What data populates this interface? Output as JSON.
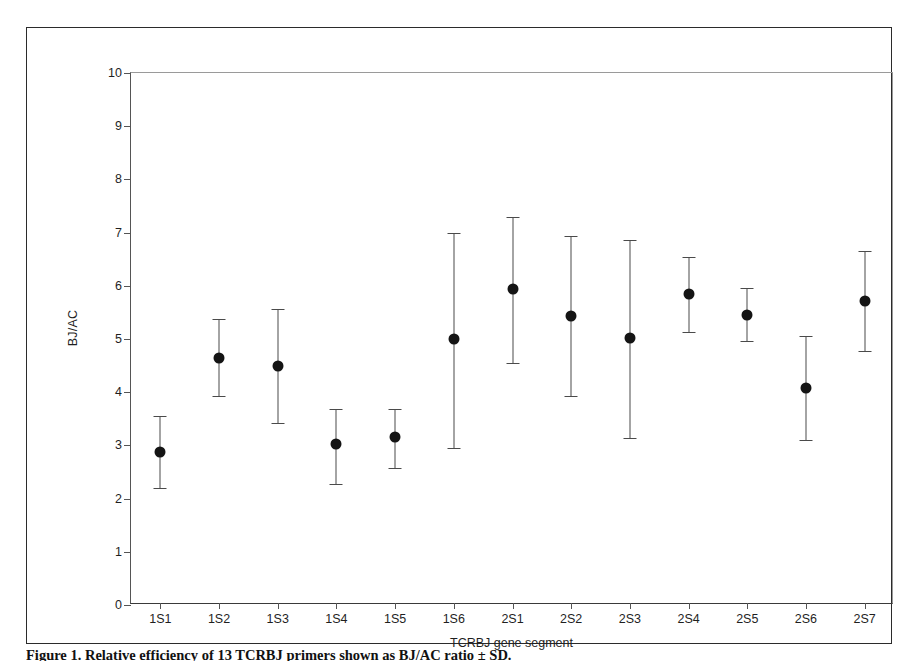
{
  "chart_data": {
    "type": "scatter",
    "title": "",
    "xlabel": "TCRBJ gene segment",
    "ylabel": "BJ/AC",
    "ylim": [
      0,
      10
    ],
    "yticks": [
      0,
      1,
      2,
      3,
      4,
      5,
      6,
      7,
      8,
      9,
      10
    ],
    "ytick_labels": [
      "0",
      "1",
      "2",
      "3",
      "4",
      "5",
      "6",
      "7",
      "8",
      "9",
      "10"
    ],
    "grid": false,
    "legend": "none",
    "error_bars": "vertical",
    "marker": "filled-circle",
    "categories": [
      "1S1",
      "1S2",
      "1S3",
      "1S4",
      "1S5",
      "1S6",
      "2S1",
      "2S2",
      "2S3",
      "2S4",
      "2S5",
      "2S6",
      "2S7"
    ],
    "values": [
      2.88,
      4.65,
      4.5,
      3.02,
      3.15,
      5.0,
      5.94,
      5.43,
      5.02,
      5.85,
      5.46,
      4.08,
      5.71
    ],
    "err_low": [
      2.2,
      3.93,
      3.42,
      2.28,
      2.58,
      2.95,
      4.55,
      3.92,
      3.13,
      5.13,
      4.96,
      3.11,
      4.78
    ],
    "err_high": [
      3.55,
      5.38,
      5.56,
      3.68,
      3.68,
      6.99,
      7.29,
      6.94,
      6.86,
      6.54,
      5.96,
      5.06,
      6.65
    ],
    "series": [
      {
        "name": "BJ/AC ratio",
        "points": [
          {
            "category": "1S1",
            "value": 2.88,
            "low": 2.2,
            "high": 3.55
          },
          {
            "category": "1S2",
            "value": 4.65,
            "low": 3.93,
            "high": 5.38
          },
          {
            "category": "1S3",
            "value": 4.5,
            "low": 3.42,
            "high": 5.56
          },
          {
            "category": "1S4",
            "value": 3.02,
            "low": 2.28,
            "high": 3.68
          },
          {
            "category": "1S5",
            "value": 3.15,
            "low": 2.58,
            "high": 3.68
          },
          {
            "category": "1S6",
            "value": 5.0,
            "low": 2.95,
            "high": 6.99
          },
          {
            "category": "2S1",
            "value": 5.94,
            "low": 4.55,
            "high": 7.29
          },
          {
            "category": "2S2",
            "value": 5.43,
            "low": 3.92,
            "high": 6.94
          },
          {
            "category": "2S3",
            "value": 5.02,
            "low": 3.13,
            "high": 6.86
          },
          {
            "category": "2S4",
            "value": 5.85,
            "low": 5.13,
            "high": 6.54
          },
          {
            "category": "2S5",
            "value": 5.46,
            "low": 4.96,
            "high": 5.96
          },
          {
            "category": "2S6",
            "value": 4.08,
            "low": 3.11,
            "high": 5.06
          },
          {
            "category": "2S7",
            "value": 5.71,
            "low": 4.78,
            "high": 6.65
          }
        ]
      }
    ]
  },
  "caption": {
    "text": "Figure 1. Relative efficiency of 13 TCRBJ primers shown as BJ/AC ratio ± SD."
  }
}
